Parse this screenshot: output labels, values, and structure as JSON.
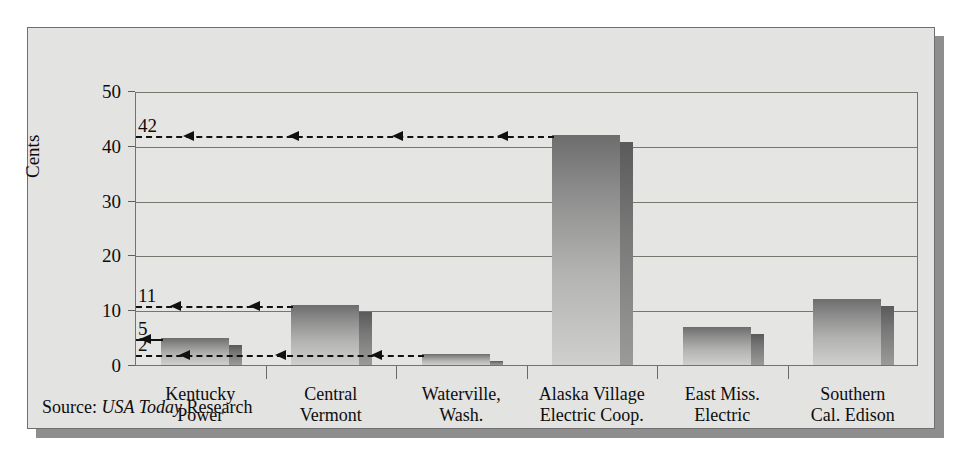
{
  "chart_data": {
    "type": "bar",
    "title": "",
    "xlabel": "",
    "ylabel": "Cents",
    "ylim": [
      0,
      50
    ],
    "yticks": [
      0,
      10,
      20,
      30,
      40,
      50
    ],
    "grid": true,
    "legend": null,
    "categories": [
      "Kentucky Power",
      "Central Vermont",
      "Waterville, Wash.",
      "Alaska Village Electric Coop.",
      "East Miss. Electric",
      "Southern Cal. Edison"
    ],
    "category_lines": [
      [
        "Kentucky",
        "Power"
      ],
      [
        "Central",
        "Vermont"
      ],
      [
        "Waterville,",
        "Wash."
      ],
      [
        "Alaska Village",
        "Electric Coop."
      ],
      [
        "East Miss.",
        "Electric"
      ],
      [
        "Southern",
        "Cal. Edison"
      ]
    ],
    "values": [
      5,
      11,
      2,
      42,
      7,
      12
    ],
    "annotations": [
      {
        "value": "42",
        "y": 42,
        "target_category": "Alaska Village Electric Coop.",
        "style": "dashed",
        "arrowheads": 4
      },
      {
        "value": "11",
        "y": 11,
        "target_category": "Central Vermont",
        "style": "dashed",
        "arrowheads": 2
      },
      {
        "value": "5",
        "y": 5,
        "target_category": "Kentucky Power",
        "style": "solid",
        "arrowheads": 1
      },
      {
        "value": "2",
        "y": 2,
        "target_category": "Waterville, Wash.",
        "style": "dashed",
        "arrowheads": 3
      }
    ],
    "source": {
      "prefix": "Source:",
      "italic": "USA Today",
      "suffix": "Research"
    },
    "colors": {
      "panel_background": "#e3e3e1",
      "plot_background": "#e5e5e3",
      "gridline": "#77776f",
      "bar_top": "#6d6d6d",
      "bar_bottom": "#cfcfcd",
      "bar_side": "#5a5a5a",
      "text": "#0d0d0d",
      "frame": "#6f6f6f",
      "shadow": "#8e8e8e"
    }
  }
}
